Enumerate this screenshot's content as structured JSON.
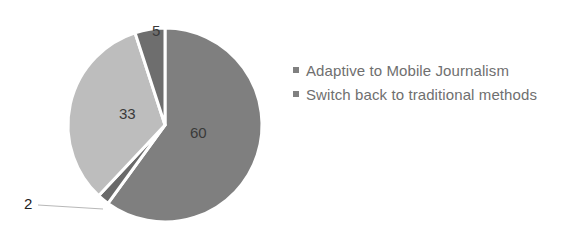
{
  "chart_data": {
    "type": "pie",
    "title": "",
    "categories": [
      "Adaptive to Mobile Journalism (a)",
      "Adaptive to Mobile Journalism (b)",
      "Switch back to traditional methods",
      "Adaptive to Mobile Journalism (c)"
    ],
    "values": [
      60,
      2,
      33,
      5
    ],
    "slice_labels": [
      "60",
      "2",
      "33",
      "5"
    ],
    "slice_colors": [
      "#7f7f7f",
      "#6a6a6a",
      "#bdbdbd",
      "#6e6e6e"
    ],
    "start_angle_deg": 0,
    "direction": "clockwise",
    "legend": {
      "position": "right",
      "entries": [
        {
          "label": "Adaptive to Mobile Journalism",
          "color": "#808080"
        },
        {
          "label": "Switch back to traditional methods",
          "color": "#808080"
        }
      ]
    }
  },
  "legend": {
    "items": [
      {
        "label": "Adaptive to Mobile Journalism"
      },
      {
        "label": "Switch back to traditional methods"
      }
    ]
  },
  "labels": {
    "s60": "60",
    "s2": "2",
    "s33": "33",
    "s5": "5"
  }
}
